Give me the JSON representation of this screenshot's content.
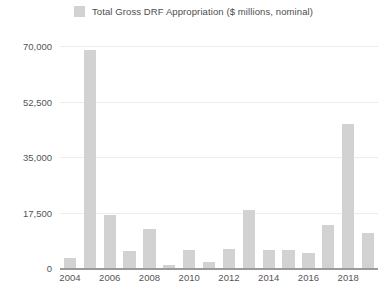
{
  "legend": {
    "swatch_color": "#d2d2d2",
    "label": "Total Gross DRF Appropriation ($ millions, nominal)"
  },
  "axis": {
    "y_ticks": [
      "0",
      "17,500",
      "35,000",
      "52,500",
      "70,000"
    ],
    "x_ticks": [
      "2004",
      "2006",
      "2008",
      "2010",
      "2012",
      "2014",
      "2016",
      "2018"
    ]
  },
  "chart_data": {
    "type": "bar",
    "title": "",
    "subtitle": "",
    "xlabel": "",
    "ylabel": "",
    "ylim": [
      0,
      70000
    ],
    "yticks": [
      0,
      17500,
      35000,
      52500,
      70000
    ],
    "grid": true,
    "legend_position": "top-center",
    "bar_color": "#d2d2d2",
    "categories": [
      "2004",
      "2005",
      "2006",
      "2007",
      "2008",
      "2009",
      "2010",
      "2011",
      "2012",
      "2013",
      "2014",
      "2015",
      "2016",
      "2017",
      "2018",
      "2019"
    ],
    "series": [
      {
        "name": "Total Gross DRF Appropriation ($ millions, nominal)",
        "values": [
          3300,
          68700,
          16600,
          5500,
          12400,
          800,
          5800,
          1900,
          5900,
          18400,
          5800,
          5700,
          4800,
          13700,
          45500,
          11000
        ]
      }
    ]
  }
}
